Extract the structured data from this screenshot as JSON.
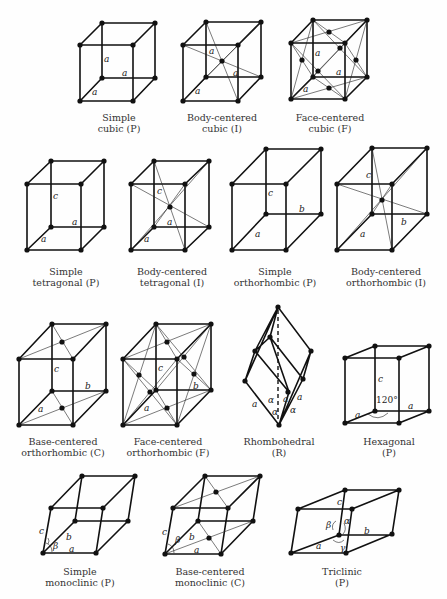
{
  "figure": {
    "lattices": [
      {
        "id": "simple-cubic",
        "line1": "Simple",
        "line2": "cubic (P)",
        "labels": [
          "a",
          "a",
          "a"
        ]
      },
      {
        "id": "body-centered-cubic",
        "line1": "Body-centered",
        "line2": "cubic (I)",
        "labels": [
          "a",
          "a",
          "a"
        ]
      },
      {
        "id": "face-centered-cubic",
        "line1": "Face-centered",
        "line2": "cubic (F)",
        "labels": [
          "a",
          "a",
          "a"
        ]
      },
      {
        "id": "simple-tetragonal",
        "line1": "Simple",
        "line2": "tetragonal (P)",
        "labels": [
          "c",
          "a",
          "a"
        ]
      },
      {
        "id": "body-centered-tetragonal",
        "line1": "Body-centered",
        "line2": "tetragonal (I)",
        "labels": [
          "c",
          "a",
          "a"
        ]
      },
      {
        "id": "simple-orthorhombic",
        "line1": "Simple",
        "line2": "orthorhombic (P)",
        "labels": [
          "c",
          "b",
          "a"
        ]
      },
      {
        "id": "body-centered-orthorhombic",
        "line1": "Body-centered",
        "line2": "orthorhombic (I)",
        "labels": [
          "c",
          "b",
          "a"
        ]
      },
      {
        "id": "base-centered-orthorhombic",
        "line1": "Base-centered",
        "line2": "orthorhombic (C)",
        "labels": [
          "c",
          "b",
          "a"
        ]
      },
      {
        "id": "face-centered-orthorhombic",
        "line1": "Face-centered",
        "line2": "orthorhombic (F)",
        "labels": [
          "c",
          "b",
          "a"
        ]
      },
      {
        "id": "rhombohedral",
        "line1": "Rhombohedral",
        "line2": "(R)",
        "labels": [
          "a",
          "a",
          "a",
          "α",
          "α",
          "α"
        ]
      },
      {
        "id": "hexagonal",
        "line1": "Hexagonal",
        "line2": "(P)",
        "labels": [
          "c",
          "a",
          "a",
          "120°"
        ]
      },
      {
        "id": "simple-monoclinic",
        "line1": "Simple",
        "line2": "monoclinic (P)",
        "labels": [
          "c",
          "b",
          "a",
          "β"
        ]
      },
      {
        "id": "base-centered-monoclinic",
        "line1": "Base-centered",
        "line2": "monoclinic (C)",
        "labels": [
          "c",
          "b",
          "a",
          "β"
        ]
      },
      {
        "id": "triclinic",
        "line1": "Triclinic",
        "line2": "(P)",
        "labels": [
          "c",
          "b",
          "a",
          "α",
          "β",
          "γ"
        ]
      }
    ]
  }
}
